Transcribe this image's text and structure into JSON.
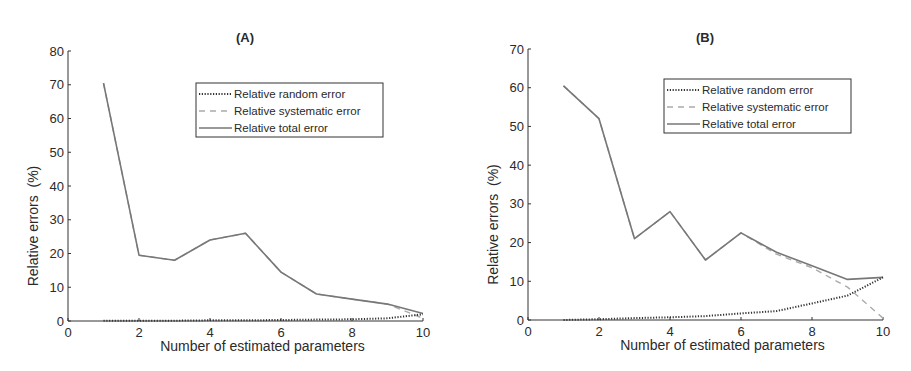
{
  "chart_data": [
    {
      "type": "line",
      "title": "(A)",
      "xlabel": "Number of estimated parameters",
      "ylabel": "Relative errors  (%)",
      "xlim": [
        0,
        10
      ],
      "ylim": [
        0,
        80
      ],
      "xticks": [
        "0",
        "2",
        "4",
        "6",
        "8",
        "10"
      ],
      "yticks": [
        "0",
        "10",
        "20",
        "30",
        "40",
        "50",
        "60",
        "70",
        "80"
      ],
      "grid": false,
      "legend_position": "upper right",
      "x": [
        1,
        2,
        3,
        4,
        5,
        6,
        7,
        8,
        9,
        10
      ],
      "series": [
        {
          "name": "Relative random error",
          "style": "dotted",
          "color": "#333333",
          "values": [
            0.1,
            0.1,
            0.1,
            0.2,
            0.2,
            0.3,
            0.4,
            0.5,
            0.8,
            2.0
          ]
        },
        {
          "name": "Relative systematic error",
          "style": "dashed",
          "color": "#aaaaaa",
          "values": [
            70.5,
            19.5,
            18,
            24,
            26,
            14.5,
            8,
            6.5,
            5,
            0.8
          ]
        },
        {
          "name": "Relative total error",
          "style": "solid",
          "color": "#777777",
          "values": [
            70.5,
            19.5,
            18,
            24,
            26,
            14.5,
            8,
            6.5,
            5,
            2.2
          ]
        }
      ]
    },
    {
      "type": "line",
      "title": "(B)",
      "xlabel": "Number of estimated parameters",
      "ylabel": "Relative errors  (%)",
      "xlim": [
        0,
        10
      ],
      "ylim": [
        0,
        70
      ],
      "xticks": [
        "0",
        "2",
        "4",
        "6",
        "8",
        "10"
      ],
      "yticks": [
        "0",
        "10",
        "20",
        "30",
        "40",
        "50",
        "60",
        "70"
      ],
      "grid": false,
      "legend_position": "upper right",
      "x": [
        1,
        2,
        3,
        4,
        5,
        6,
        7,
        8,
        9,
        10
      ],
      "series": [
        {
          "name": "Relative random error",
          "style": "dotted",
          "color": "#333333",
          "values": [
            0,
            0.2,
            0.5,
            0.7,
            1.0,
            1.7,
            2.3,
            4.3,
            6.3,
            11
          ]
        },
        {
          "name": "Relative systematic error",
          "style": "dashed",
          "color": "#aaaaaa",
          "values": [
            60.5,
            52,
            21,
            28,
            15.5,
            22.5,
            17,
            13.5,
            8.5,
            0.5
          ]
        },
        {
          "name": "Relative total error",
          "style": "solid",
          "color": "#777777",
          "values": [
            60.5,
            52,
            21,
            28,
            15.5,
            22.5,
            17.5,
            14,
            10.5,
            11
          ]
        }
      ]
    }
  ],
  "charts": [
    {
      "title": "(A)",
      "xlabel": "Number of estimated parameters",
      "ylabel": "Relative errors  (%)",
      "legend": [
        "Relative random error",
        "Relative systematic error",
        "Relative total error"
      ]
    },
    {
      "title": "(B)",
      "xlabel": "Number of estimated parameters",
      "ylabel": "Relative errors  (%)",
      "legend": [
        "Relative random error",
        "Relative systematic error",
        "Relative total error"
      ]
    }
  ]
}
